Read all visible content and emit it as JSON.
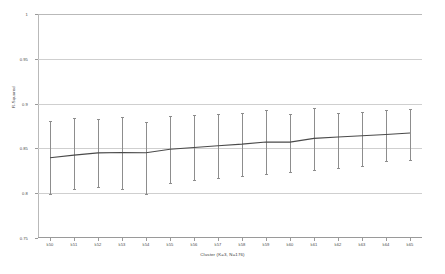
{
  "chart_data": {
    "type": "line",
    "title": "",
    "xlabel": "Cluster (K=3, N=176)",
    "ylabel": "R-Squared",
    "ylim": [
      0.75,
      1
    ],
    "yticks": [
      0.75,
      0.8,
      0.85,
      0.9,
      0.95,
      1
    ],
    "ytick_labels": [
      "0.75",
      "0.8",
      "0.85",
      "0.9",
      "0.95",
      "1"
    ],
    "grid": true,
    "legend": "none",
    "error_bars": "vertical",
    "categories": [
      "k50",
      "k51",
      "k52",
      "k53",
      "k54",
      "k55",
      "k56",
      "k57",
      "k58",
      "k59",
      "k60",
      "k61",
      "k62",
      "k63",
      "k64",
      "k65"
    ],
    "series": [
      {
        "name": "R-Squared",
        "color": "#4a4a4a",
        "values": [
          0.8395,
          0.8425,
          0.845,
          0.8455,
          0.8452,
          0.849,
          0.851,
          0.853,
          0.8548,
          0.8572,
          0.857,
          0.8612,
          0.8628,
          0.8642,
          0.8655,
          0.8672
        ],
        "error_upper": [
          0.881,
          0.8835,
          0.883,
          0.8855,
          0.88,
          0.886,
          0.887,
          0.888,
          0.89,
          0.8925,
          0.8885,
          0.8955,
          0.889,
          0.8905,
          0.893,
          0.8935
        ],
        "error_lower": [
          0.799,
          0.805,
          0.8065,
          0.8045,
          0.799,
          0.811,
          0.815,
          0.8175,
          0.819,
          0.8215,
          0.824,
          0.826,
          0.8285,
          0.83,
          0.8355,
          0.8375
        ]
      }
    ]
  },
  "axis": {
    "y_title": "R-Squared",
    "x_title": "Cluster (K=3, N=176)"
  }
}
